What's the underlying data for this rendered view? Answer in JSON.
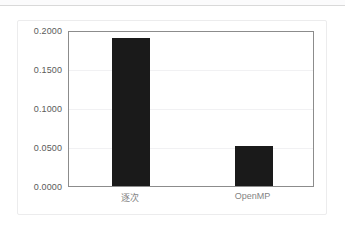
{
  "page": {
    "background": "#ffffff",
    "rule_color": "#d9d9d9"
  },
  "card": {
    "background": "#ffffff",
    "border_color": "#ececed"
  },
  "chart_data": {
    "type": "bar",
    "title": "",
    "subtitle": "",
    "xlabel": "",
    "ylabel": "",
    "categories": [
      "逐次",
      "OpenMP"
    ],
    "values": [
      0.19,
      0.051
    ],
    "ylim": [
      0.0,
      0.2
    ],
    "ytick_values": [
      0.0,
      0.05,
      0.1,
      0.15,
      0.2
    ],
    "ytick_labels": [
      "0.0000",
      "0.0500",
      "0.1000",
      "0.1500",
      "0.2000"
    ],
    "grid": true,
    "grid_axis": "y",
    "legend": false,
    "legend_position": "none",
    "bar_color": "#1a1a1a",
    "plot_border_color": "#8c8c8c",
    "gridline_color": "#f1f1f3",
    "tick_label_color": "#5a5a5a",
    "category_label_color": "#848484"
  }
}
